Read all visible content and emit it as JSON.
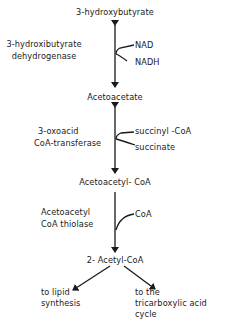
{
  "diagram": {
    "nodes": {
      "hydroxybutyrate": "3-hydroxybutyrate",
      "acetoacetate": "Acetoacetate",
      "acetoacetyl_coa": "Acetoacetyl- CoA",
      "acetyl_coa": "2- Acetyl-CoA"
    },
    "enzymes": {
      "e1_line1": "3-hydroxibutyrate",
      "e1_line2": "dehydrogenase",
      "e2_line1": "3-oxoacid",
      "e2_line2": "CoA-transferase",
      "e3_line1": "Acetoacetyl",
      "e3_line2": "CoA thiolase"
    },
    "cofactors": {
      "nad": "NAD",
      "nadh": "NADH",
      "succinyl_coa": "succinyl -CoA",
      "succinate": "succinate",
      "coa": "CoA"
    },
    "outputs": {
      "lipid_line1": "to lipid",
      "lipid_line2": "synthesis",
      "tca_line1": "to the",
      "tca_line2": "tricarboxylic acid",
      "tca_line3": "cycle"
    },
    "colors": {
      "line": "#1a1a1a",
      "text": "#1a1a1a",
      "background": "#ffffff"
    }
  }
}
